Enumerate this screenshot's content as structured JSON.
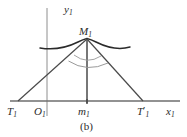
{
  "figure": {
    "caption": "(b)",
    "axes": {
      "x_axis_label": "x",
      "x_axis_subscript": "1",
      "y_axis_label": "y",
      "y_axis_subscript": "1",
      "origin_label": "O",
      "origin_subscript": "1"
    },
    "points": [
      {
        "id": "apex",
        "label": "M",
        "subscript": "1",
        "prime": "",
        "x": 87,
        "y": 40,
        "description": "apex-of-triangle-on-curve"
      },
      {
        "id": "left-vertex",
        "label": "T",
        "subscript": "1",
        "prime": "",
        "x": 18,
        "y": 101,
        "description": "left-base-vertex-on-x-axis"
      },
      {
        "id": "foot",
        "label": "m",
        "subscript": "1",
        "prime": "",
        "x": 87,
        "y": 101,
        "description": "foot-of-vertical-from-apex"
      },
      {
        "id": "right-vertex",
        "label": "T",
        "subscript": "1",
        "prime": "′",
        "x": 143,
        "y": 101,
        "description": "right-base-vertex-on-x-axis"
      }
    ],
    "colors": {
      "ink": "#2b2b2b",
      "line": "#4a4a4a",
      "axis": "#6e6e6e",
      "curve": "#2b2b2b",
      "arc": "#8e8e8e",
      "background": "#ffffff"
    },
    "geometry": {
      "x_axis_y": 101,
      "x_axis_x_start": 10,
      "x_axis_x_end": 180,
      "y_axis_x": 47,
      "y_axis_y_top": 8,
      "y_axis_y_bottom": 116,
      "curve_x_start": 40,
      "curve_x_end": 130,
      "curve_apex_x": 87,
      "curve_apex_y": 40,
      "curve_end_y": 48,
      "angle_arc_outer_radius": 26,
      "angle_arc_inner_radius": 18
    }
  }
}
